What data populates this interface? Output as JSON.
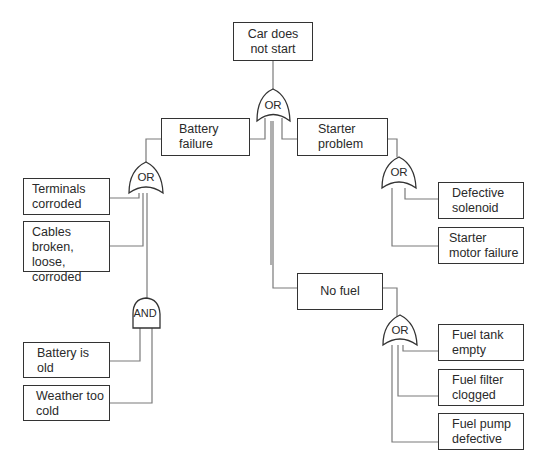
{
  "diagram": {
    "type": "fault-tree",
    "top_event": "Car does not start",
    "nodes": [
      {
        "id": "top",
        "label_lines": [
          "Car does",
          "not start"
        ]
      },
      {
        "id": "battery",
        "label_lines": [
          "Battery",
          "failure"
        ]
      },
      {
        "id": "starter",
        "label_lines": [
          "Starter",
          "problem"
        ]
      },
      {
        "id": "terminals",
        "label_lines": [
          "Terminals",
          "corroded"
        ]
      },
      {
        "id": "cables",
        "label_lines": [
          "Cables",
          "broken, loose,",
          "corroded"
        ]
      },
      {
        "id": "solenoid",
        "label_lines": [
          "Defective",
          "solenoid"
        ]
      },
      {
        "id": "motor",
        "label_lines": [
          "Starter",
          "motor failure"
        ]
      },
      {
        "id": "nofuel",
        "label_lines": [
          "No fuel"
        ]
      },
      {
        "id": "old",
        "label_lines": [
          "Battery is",
          "old"
        ]
      },
      {
        "id": "cold",
        "label_lines": [
          "Weather too",
          "cold"
        ]
      },
      {
        "id": "tank",
        "label_lines": [
          "Fuel tank",
          "empty"
        ]
      },
      {
        "id": "filter",
        "label_lines": [
          "Fuel filter",
          "clogged"
        ]
      },
      {
        "id": "pump",
        "label_lines": [
          "Fuel pump",
          "defective"
        ]
      }
    ],
    "gates": [
      {
        "id": "g_top",
        "type": "OR",
        "label": "OR",
        "output": "top",
        "inputs": [
          "battery",
          "starter",
          "nofuel"
        ]
      },
      {
        "id": "g_battery",
        "type": "OR",
        "label": "OR",
        "output": "battery",
        "inputs": [
          "terminals",
          "cables",
          "g_and"
        ]
      },
      {
        "id": "g_and",
        "type": "AND",
        "label": "AND",
        "inputs": [
          "old",
          "cold"
        ]
      },
      {
        "id": "g_starter",
        "type": "OR",
        "label": "OR",
        "output": "starter",
        "inputs": [
          "solenoid",
          "motor"
        ]
      },
      {
        "id": "g_fuel",
        "type": "OR",
        "label": "OR",
        "output": "nofuel",
        "inputs": [
          "tank",
          "filter",
          "pump"
        ]
      }
    ],
    "line_color": "#777777",
    "border_color": "#333333"
  }
}
